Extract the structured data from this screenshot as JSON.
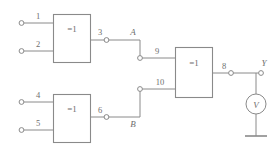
{
  "diagram": {
    "colors": {
      "wire": "#8a8a8a",
      "text": "#6e6e6e",
      "background": "#ffffff"
    },
    "gates": [
      {
        "id": "gate-1",
        "label": "=1",
        "inputs": [
          "1",
          "2"
        ],
        "output": "3"
      },
      {
        "id": "gate-2",
        "label": "=1",
        "inputs": [
          "4",
          "5"
        ],
        "output": "6"
      },
      {
        "id": "gate-3",
        "label": "=1",
        "inputs": [
          "9",
          "10"
        ],
        "output": "8"
      }
    ],
    "pins": {
      "p1": "1",
      "p2": "2",
      "p3": "3",
      "p4": "4",
      "p5": "5",
      "p6": "6",
      "p8": "8",
      "p9": "9",
      "p10": "10"
    },
    "nodes": {
      "a": "A",
      "b": "B",
      "y": "Y"
    },
    "instrument": {
      "symbol": "V",
      "name": "voltmeter"
    }
  }
}
